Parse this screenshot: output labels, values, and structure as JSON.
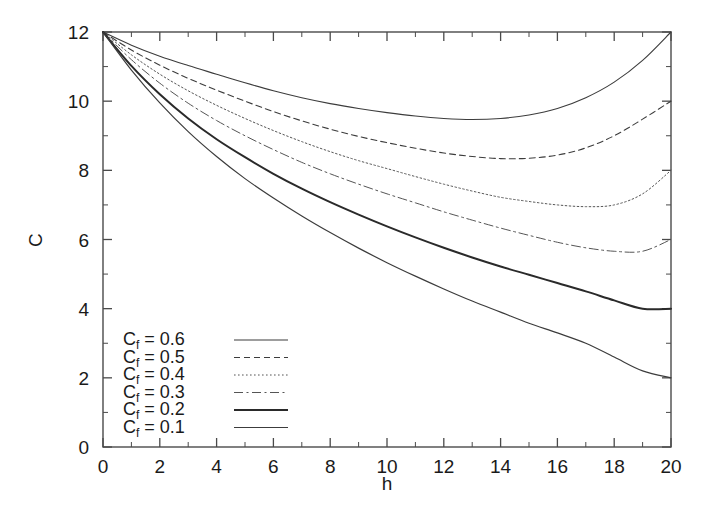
{
  "chart_data": {
    "type": "line",
    "title": "",
    "xlabel": "h",
    "ylabel": "C",
    "xlim": [
      0,
      20
    ],
    "ylim": [
      0,
      12
    ],
    "xticks": [
      0,
      2,
      4,
      6,
      8,
      10,
      12,
      14,
      16,
      18,
      20
    ],
    "xtick_labels": [
      "0",
      "2",
      "4",
      "6",
      "8",
      "10",
      "12",
      "14",
      "16",
      "18",
      "20"
    ],
    "yticks": [
      0,
      2,
      4,
      6,
      8,
      10,
      12
    ],
    "ytick_labels": [
      "0",
      "2",
      "4",
      "6",
      "8",
      "10",
      "12"
    ],
    "minor_xtick_step": 1,
    "minor_ytick_step": 1,
    "grid": false,
    "frame": true,
    "tick_direction": "in",
    "legend_position": "lower-left",
    "legend_border": false,
    "x": [
      0,
      1,
      2,
      3,
      4,
      5,
      6,
      7,
      8,
      9,
      10,
      11,
      12,
      13,
      14,
      15,
      16,
      17,
      18,
      19,
      20
    ],
    "series": [
      {
        "name": "C_f = 0.6",
        "legend_prefix": "C",
        "legend_subscript": "f",
        "legend_value": "= 0.6",
        "cf": 0.6,
        "style": "solid",
        "width": 1.1,
        "color": "#3c3c3c",
        "minimum": {
          "h": 11.9,
          "C": 9.45
        },
        "values": [
          12.0,
          11.62,
          11.3,
          11.03,
          10.78,
          10.53,
          10.3,
          10.1,
          9.93,
          9.79,
          9.67,
          9.57,
          9.5,
          9.47,
          9.5,
          9.6,
          9.79,
          10.1,
          10.55,
          11.18,
          12.0
        ]
      },
      {
        "name": "C_f = 0.5",
        "legend_prefix": "C",
        "legend_subscript": "f",
        "legend_value": "= 0.5",
        "cf": 0.5,
        "style": "dashed",
        "width": 1.1,
        "color": "#3c3c3c",
        "minimum": {
          "h": 13.0,
          "C": 8.2
        },
        "values": [
          12.0,
          11.48,
          11.04,
          10.66,
          10.32,
          10.0,
          9.7,
          9.43,
          9.19,
          8.98,
          8.8,
          8.64,
          8.5,
          8.4,
          8.34,
          8.35,
          8.44,
          8.65,
          9.0,
          9.48,
          10.0
        ]
      },
      {
        "name": "C_f = 0.4",
        "legend_prefix": "C",
        "legend_subscript": "f",
        "legend_value": "= 0.4",
        "cf": 0.4,
        "style": "dotted",
        "width": 1.0,
        "color": "#555555",
        "minimum": {
          "h": 14.0,
          "C": 6.85
        },
        "values": [
          12.0,
          11.34,
          10.78,
          10.3,
          9.88,
          9.5,
          9.15,
          8.83,
          8.54,
          8.28,
          8.05,
          7.82,
          7.6,
          7.4,
          7.22,
          7.1,
          7.0,
          6.95,
          7.0,
          7.32,
          8.0
        ]
      },
      {
        "name": "C_f = 0.3",
        "legend_prefix": "C",
        "legend_subscript": "f",
        "legend_value": "= 0.3",
        "cf": 0.3,
        "style": "dashdot",
        "width": 1.0,
        "color": "#555555",
        "minimum": {
          "h": 15.7,
          "C": 5.35
        },
        "values": [
          12.0,
          11.2,
          10.52,
          9.94,
          9.44,
          9.0,
          8.6,
          8.23,
          7.9,
          7.6,
          7.32,
          7.06,
          6.8,
          6.56,
          6.33,
          6.12,
          5.92,
          5.76,
          5.66,
          5.66,
          6.0
        ]
      },
      {
        "name": "C_f = 0.2",
        "legend_prefix": "C",
        "legend_subscript": "f",
        "legend_value": "= 0.2",
        "cf": 0.2,
        "style": "solid",
        "width": 2.0,
        "color": "#2a2a2a",
        "minimum": {
          "h": 17.1,
          "C": 3.75
        },
        "values": [
          12.0,
          11.02,
          10.2,
          9.5,
          8.9,
          8.38,
          7.9,
          7.47,
          7.08,
          6.72,
          6.38,
          6.06,
          5.76,
          5.48,
          5.22,
          4.98,
          4.74,
          4.5,
          4.24,
          4.0,
          4.0
        ]
      },
      {
        "name": "C_f = 0.1",
        "legend_prefix": "C",
        "legend_subscript": "f",
        "legend_value": "= 0.1",
        "cf": 0.1,
        "style": "solid",
        "width": 1.2,
        "color": "#3c3c3c",
        "minimum": {
          "h": 18.0,
          "C": 1.95
        },
        "values": [
          12.0,
          10.9,
          9.95,
          9.12,
          8.4,
          7.76,
          7.2,
          6.68,
          6.2,
          5.75,
          5.33,
          4.94,
          4.57,
          4.22,
          3.9,
          3.58,
          3.3,
          3.0,
          2.6,
          2.2,
          2.0
        ]
      }
    ]
  },
  "axes": {
    "x_title": "h",
    "y_title": "C"
  }
}
